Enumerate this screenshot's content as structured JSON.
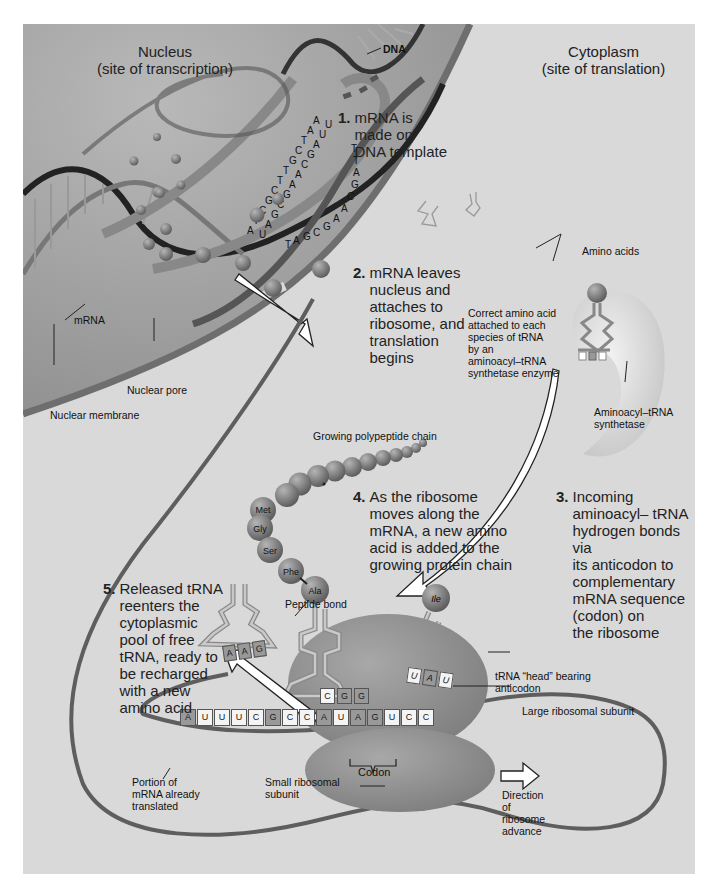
{
  "figure": {
    "colors": {
      "background": "#ffffff",
      "panel": "#d9d9d9",
      "nucleus": "#9a9a9a",
      "membrane": "#707070",
      "ribosome": "#8c8c8c",
      "amino_acid": "#7a7a7a",
      "text": "#1a1a1a"
    }
  },
  "regions": {
    "nucleus": {
      "title": "Nucleus",
      "subtitle": "(site of transcription)"
    },
    "cytoplasm": {
      "title": "Cytoplasm",
      "subtitle": "(site of translation)"
    }
  },
  "labels": {
    "dna": "DNA",
    "mrna": "mRNA",
    "nuclear_pore": "Nuclear pore",
    "nuclear_membrane": "Nuclear membrane",
    "amino_acids": "Amino acids",
    "correct_amino_acid": [
      "Correct amino acid",
      "attached to each",
      "species of tRNA",
      "by an",
      "aminoacyl–tRNA",
      "synthetase enzyme"
    ],
    "synthetase": [
      "Aminoacyl–tRNA",
      "synthetase"
    ],
    "growing_chain": "Growing polypeptide chain",
    "peptide_bond": "Peptide bond",
    "trna_head": [
      "tRNA “head” bearing",
      "anticodon"
    ],
    "large_subunit": "Large ribosomal subunit",
    "small_subunit": [
      "Small ribosomal",
      "subunit"
    ],
    "codon": "Codon",
    "portion_translated": [
      "Portion of",
      "mRNA already",
      "translated"
    ],
    "direction": [
      "Direction",
      "of",
      "ribosome",
      "advance"
    ]
  },
  "steps": [
    {
      "num": "1.",
      "lines": [
        "mRNA is",
        "made on",
        "DNA template"
      ]
    },
    {
      "num": "2.",
      "lines": [
        "mRNA leaves",
        "nucleus and",
        "attaches to",
        "ribosome, and",
        "translation",
        "begins"
      ]
    },
    {
      "num": "3.",
      "lines": [
        "Incoming",
        "aminoacyl– tRNA",
        "hydrogen bonds via",
        "its anticodon to",
        "complementary",
        "mRNA sequence",
        "(codon) on",
        "the ribosome"
      ]
    },
    {
      "num": "4.",
      "lines": [
        "As the ribosome",
        "moves along the",
        "mRNA, a new amino",
        "acid is added to the",
        "growing protein chain"
      ]
    },
    {
      "num": "5.",
      "lines": [
        "Released tRNA",
        "reenters the",
        "cytoplasmic",
        "pool of free",
        "tRNA, ready to",
        "be recharged",
        "with a new",
        "amino acid"
      ]
    }
  ],
  "amino_acids_chain": [
    "Met",
    "Gly",
    "Ser",
    "Phe",
    "Ala"
  ],
  "incoming_amino_acid": "Ile",
  "anticodons": {
    "released_trna": [
      "A",
      "A",
      "G"
    ],
    "bound_trna": [
      "C",
      "G",
      "G"
    ],
    "incoming_trna": [
      "U",
      "A",
      "U"
    ]
  },
  "mrna_sequence": [
    "A",
    "U",
    "U",
    "U",
    "C",
    "G",
    "C",
    "C",
    "A",
    "U",
    "A",
    "G",
    "U",
    "C",
    "C"
  ],
  "dna_template_letters": {
    "left_strand": [
      "A",
      "A",
      "T",
      "C",
      "G",
      "T",
      "T",
      "C",
      "G",
      "C",
      "T",
      "A"
    ],
    "right_strand": [
      "U",
      "U",
      "A",
      "G",
      "C",
      "A",
      "A",
      "G",
      "C",
      "G",
      "A",
      "U"
    ],
    "mrna_strand": [
      "T",
      "T",
      "A",
      "G",
      "C",
      "A",
      "A",
      "G",
      "C",
      "G",
      "A",
      "T"
    ]
  }
}
